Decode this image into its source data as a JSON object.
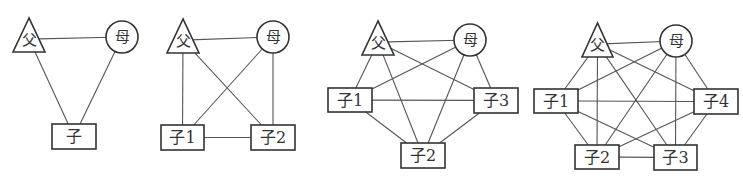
{
  "colors": {
    "line": "#555555",
    "stroke": "#333333",
    "text": "#333333",
    "background": "#ffffff"
  },
  "legend": {
    "triangle": "male (father)",
    "circle": "female (mother)",
    "rectangle": "child"
  },
  "diagrams": [
    {
      "id": "family-1-child",
      "nodes": [
        {
          "id": "F",
          "label": "父",
          "shape": "triangle",
          "x": 13,
          "y": 18,
          "w": 32,
          "h": 34
        },
        {
          "id": "M",
          "label": "母",
          "shape": "circle",
          "cx": 122,
          "cy": 37,
          "r": 16
        },
        {
          "id": "C",
          "label": "子",
          "shape": "rect",
          "x": 52,
          "y": 124,
          "w": 44,
          "h": 25
        }
      ],
      "edges": [
        [
          "F",
          "M"
        ],
        [
          "F",
          "C"
        ],
        [
          "M",
          "C"
        ]
      ]
    },
    {
      "id": "family-2-children",
      "nodes": [
        {
          "id": "F",
          "label": "父",
          "shape": "triangle",
          "x": 167,
          "y": 19,
          "w": 32,
          "h": 34
        },
        {
          "id": "M",
          "label": "母",
          "shape": "circle",
          "cx": 273,
          "cy": 37,
          "r": 16
        },
        {
          "id": "C1",
          "label": "子1",
          "shape": "rect",
          "x": 161,
          "y": 125,
          "w": 43,
          "h": 25
        },
        {
          "id": "C2",
          "label": "子2",
          "shape": "rect",
          "x": 251,
          "y": 125,
          "w": 44,
          "h": 25
        }
      ],
      "edges": [
        [
          "F",
          "M"
        ],
        [
          "F",
          "C1"
        ],
        [
          "F",
          "C2"
        ],
        [
          "M",
          "C1"
        ],
        [
          "M",
          "C2"
        ],
        [
          "C1",
          "C2"
        ]
      ]
    },
    {
      "id": "family-3-children",
      "nodes": [
        {
          "id": "F",
          "label": "父",
          "shape": "triangle",
          "x": 362,
          "y": 21,
          "w": 32,
          "h": 34
        },
        {
          "id": "M",
          "label": "母",
          "shape": "circle",
          "cx": 470,
          "cy": 40,
          "r": 16
        },
        {
          "id": "C1",
          "label": "子1",
          "shape": "rect",
          "x": 328,
          "y": 88,
          "w": 44,
          "h": 24
        },
        {
          "id": "C2",
          "label": "子2",
          "shape": "rect",
          "x": 401,
          "y": 143,
          "w": 44,
          "h": 25
        },
        {
          "id": "C3",
          "label": "子3",
          "shape": "rect",
          "x": 474,
          "y": 88,
          "w": 44,
          "h": 25
        }
      ],
      "edges": [
        [
          "F",
          "M"
        ],
        [
          "F",
          "C1"
        ],
        [
          "F",
          "C2"
        ],
        [
          "F",
          "C3"
        ],
        [
          "M",
          "C1"
        ],
        [
          "M",
          "C2"
        ],
        [
          "M",
          "C3"
        ],
        [
          "C1",
          "C2"
        ],
        [
          "C1",
          "C3"
        ],
        [
          "C2",
          "C3"
        ]
      ]
    },
    {
      "id": "family-4-children",
      "nodes": [
        {
          "id": "F",
          "label": "父",
          "shape": "triangle",
          "x": 582,
          "y": 23,
          "w": 31,
          "h": 34
        },
        {
          "id": "M",
          "label": "母",
          "shape": "circle",
          "cx": 676,
          "cy": 41,
          "r": 16
        },
        {
          "id": "C1",
          "label": "子1",
          "shape": "rect",
          "x": 534,
          "y": 89,
          "w": 44,
          "h": 24
        },
        {
          "id": "C2",
          "label": "子2",
          "shape": "rect",
          "x": 575,
          "y": 145,
          "w": 44,
          "h": 24
        },
        {
          "id": "C3",
          "label": "子3",
          "shape": "rect",
          "x": 654,
          "y": 145,
          "w": 43,
          "h": 25
        },
        {
          "id": "C4",
          "label": "子4",
          "shape": "rect",
          "x": 694,
          "y": 89,
          "w": 44,
          "h": 25
        }
      ],
      "edges": [
        [
          "F",
          "M"
        ],
        [
          "F",
          "C1"
        ],
        [
          "F",
          "C2"
        ],
        [
          "F",
          "C3"
        ],
        [
          "F",
          "C4"
        ],
        [
          "M",
          "C1"
        ],
        [
          "M",
          "C2"
        ],
        [
          "M",
          "C3"
        ],
        [
          "M",
          "C4"
        ],
        [
          "C1",
          "C2"
        ],
        [
          "C1",
          "C3"
        ],
        [
          "C1",
          "C4"
        ],
        [
          "C2",
          "C3"
        ],
        [
          "C2",
          "C4"
        ],
        [
          "C3",
          "C4"
        ]
      ]
    }
  ]
}
